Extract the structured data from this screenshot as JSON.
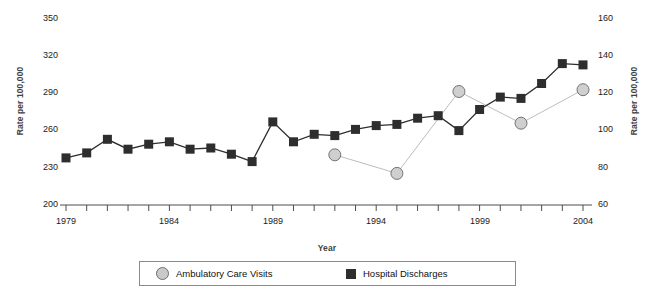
{
  "chart_data": {
    "type": "line",
    "title": "",
    "xlabel": "Year",
    "ylabel": "Rate per 100,000",
    "ylabel_right": "Rate per 100,000",
    "grid": false,
    "legend_position": "bottom",
    "x": [
      1979,
      1980,
      1981,
      1982,
      1983,
      1984,
      1985,
      1986,
      1987,
      1988,
      1989,
      1990,
      1991,
      1992,
      1993,
      1994,
      1995,
      1996,
      1997,
      1998,
      1999,
      2000,
      2001,
      2002,
      2003,
      2004
    ],
    "xticks": [
      1979,
      1984,
      1989,
      1994,
      1999,
      2004
    ],
    "ylim_left": [
      200,
      350
    ],
    "yticks_left": [
      200,
      230,
      260,
      290,
      320,
      350
    ],
    "ylim_right": [
      60,
      160
    ],
    "yticks_right": [
      60,
      80,
      100,
      120,
      140,
      160
    ],
    "series": [
      {
        "name": "Hospital Discharges",
        "axis": "left",
        "marker": "square",
        "color": "#2e2e2e",
        "x": [
          1979,
          1980,
          1981,
          1982,
          1983,
          1984,
          1985,
          1986,
          1987,
          1988,
          1989,
          1990,
          1991,
          1992,
          1993,
          1994,
          1995,
          1996,
          1997,
          1998,
          1999,
          2000,
          2001,
          2002,
          2003,
          2004
        ],
        "values": [
          238,
          242,
          253,
          245,
          249,
          251,
          245,
          246,
          241,
          235,
          267,
          251,
          257,
          256,
          261,
          264,
          265,
          270,
          272,
          260,
          277,
          287,
          286,
          298,
          314,
          313
        ]
      },
      {
        "name": "Ambulatory Care Visits",
        "axis": "right",
        "marker": "circle",
        "color": "#c9c9c9",
        "x": [
          1992,
          1995,
          1998,
          2001,
          2004
        ],
        "values": [
          87,
          77,
          121,
          104,
          122
        ]
      }
    ]
  },
  "legend": {
    "items": [
      {
        "label": "Ambulatory Care Visits",
        "marker": "circle"
      },
      {
        "label": "Hospital Discharges",
        "marker": "square"
      }
    ]
  },
  "axes": {
    "left": {
      "title": "Rate per 100,000",
      "ticks": [
        "350",
        "320",
        "290",
        "260",
        "230",
        "200"
      ]
    },
    "right": {
      "title": "Rate per 100,000",
      "ticks": [
        "160",
        "140",
        "120",
        "100",
        "80",
        "60"
      ]
    },
    "x": {
      "title": "Year",
      "ticks": [
        "1979",
        "1984",
        "1989",
        "1994",
        "1999",
        "2004"
      ]
    }
  },
  "colors": {
    "hospital": "#2e2e2e",
    "ambulatory": "#c9c9c9",
    "axis": "#4d4d4d",
    "label": "#3f3f3f"
  }
}
